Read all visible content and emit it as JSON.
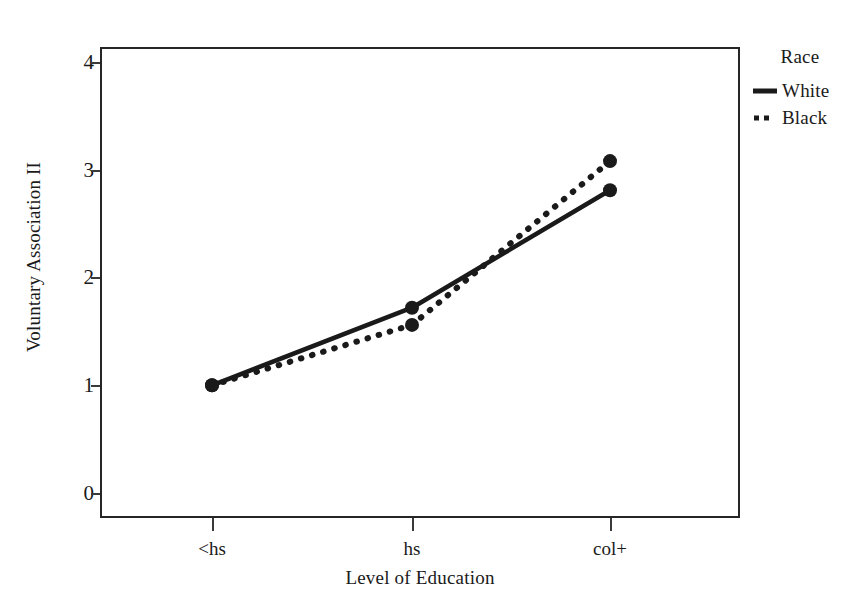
{
  "chart_data": {
    "type": "line",
    "title": "",
    "xlabel": "Level of Education",
    "ylabel": "Voluntary Association II",
    "categories": [
      "<hs",
      "hs",
      "col+"
    ],
    "x_tick_labels": [
      "<hs",
      "hs",
      "col+"
    ],
    "y_tick_labels": [
      "0",
      "1",
      "2",
      "3",
      "4"
    ],
    "y_ticks": [
      0,
      1,
      2,
      3,
      4
    ],
    "ylim": [
      -0.23,
      4.14
    ],
    "xlim": [
      -0.56,
      2.64
    ],
    "grid": false,
    "legend_position": "right",
    "legend_title": "Race",
    "series": [
      {
        "name": "White",
        "style": "solid",
        "color": "#1a1a1a",
        "marker": "circle",
        "values": [
          1.0,
          1.72,
          2.81
        ]
      },
      {
        "name": "Black",
        "style": "dotted",
        "color": "#1a1a1a",
        "marker": "circle",
        "values": [
          1.0,
          1.56,
          3.08
        ]
      }
    ]
  },
  "legend": {
    "title": "Race",
    "entries": [
      {
        "label": "White",
        "style": "solid"
      },
      {
        "label": "Black",
        "style": "dotted"
      }
    ]
  },
  "axes": {
    "x_title": "Level of Education",
    "y_title": "Voluntary Association II",
    "x_labels": [
      "<hs",
      "hs",
      "col+"
    ],
    "y_labels": [
      "4",
      "3",
      "2",
      "1",
      "0"
    ]
  },
  "colors": {
    "line": "#1a1a1a",
    "frame": "#262626",
    "background": "#ffffff",
    "text": "#1a1a1a"
  }
}
